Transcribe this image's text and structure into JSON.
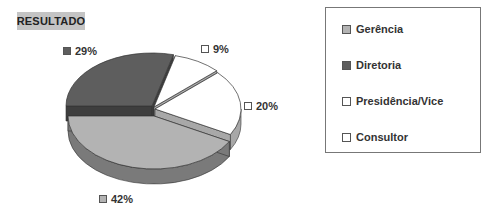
{
  "title": "RESULTADO",
  "chart_data": {
    "type": "pie",
    "title": "RESULTADO",
    "style": "3d-exploded",
    "categories": [
      "Gerência",
      "Diretoria",
      "Presidência/Vice",
      "Consultor"
    ],
    "values": [
      42,
      29,
      9,
      20
    ],
    "unit": "%",
    "data_labels": [
      "42%",
      "29%",
      "9%",
      "20%"
    ],
    "colors": [
      "#b3b3b3",
      "#5e5e5e",
      "#ffffff",
      "#ffffff"
    ],
    "legend_position": "right"
  },
  "labels": {
    "gerencia": "42%",
    "diretoria": "29%",
    "presidencia": "9%",
    "consultor": "20%"
  },
  "legend": {
    "items": [
      {
        "label": "Gerência",
        "color": "#b3b3b3"
      },
      {
        "label": "Diretoria",
        "color": "#5e5e5e"
      },
      {
        "label": "Presidência/Vice",
        "color": "#ffffff"
      },
      {
        "label": "Consultor",
        "color": "#ffffff"
      }
    ]
  }
}
